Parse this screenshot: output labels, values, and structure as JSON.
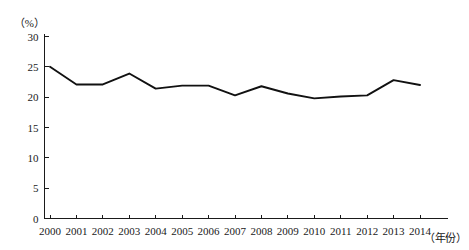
{
  "chart_data": {
    "type": "line",
    "title": "",
    "subtitle": "",
    "xlabel": "（年份）",
    "ylabel": "（%）",
    "categories": [
      "2000",
      "2001",
      "2002",
      "2003",
      "2004",
      "2005",
      "2006",
      "2007",
      "2008",
      "2009",
      "2010",
      "2011",
      "2012",
      "2013",
      "2014"
    ],
    "x": [
      2000,
      2001,
      2002,
      2003,
      2004,
      2005,
      2006,
      2007,
      2008,
      2009,
      2010,
      2011,
      2012,
      2013,
      2014
    ],
    "values": [
      25.0,
      22.1,
      22.1,
      23.9,
      21.4,
      21.9,
      21.9,
      20.3,
      21.8,
      20.6,
      19.8,
      20.1,
      20.3,
      22.8,
      22.0
    ],
    "series": [
      {
        "name": "",
        "values": [
          25.0,
          22.1,
          22.1,
          23.9,
          21.4,
          21.9,
          21.9,
          20.3,
          21.8,
          20.6,
          19.8,
          20.1,
          20.3,
          22.8,
          22.0
        ]
      }
    ],
    "ylim": [
      0,
      30
    ],
    "yticks": [
      0,
      5,
      10,
      15,
      20,
      25,
      30
    ],
    "ytick_labels": [
      "0",
      "5",
      "10",
      "15",
      "20",
      "25",
      "30"
    ],
    "xtick_labels": [
      "2000",
      "2001",
      "2002",
      "2003",
      "2004",
      "2005",
      "2006",
      "2007",
      "2008",
      "2009",
      "2010",
      "2011",
      "2012",
      "2013",
      "2014"
    ],
    "grid": false,
    "legend": false,
    "legend_position": "none",
    "line_color": "#111111",
    "axis_color": "#1a1a1a"
  }
}
